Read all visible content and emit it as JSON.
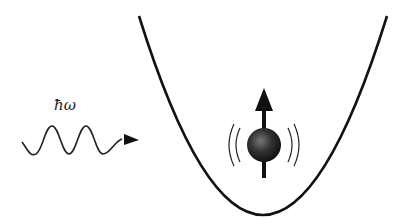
{
  "diagram": {
    "photon_label": "ħω",
    "elements": [
      "photon-wave",
      "harmonic-potential-well",
      "spin-particle",
      "vibration-arcs",
      "spin-arrow"
    ],
    "colors": {
      "stroke": "#111111",
      "ball": "#2a2a2a",
      "background": "#ffffff"
    }
  }
}
